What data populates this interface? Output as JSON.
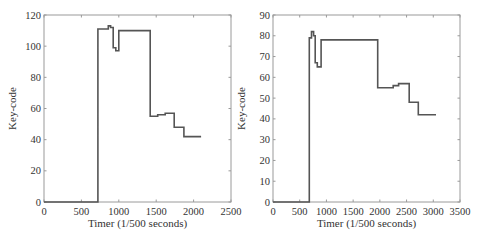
{
  "chart_data": [
    {
      "type": "line",
      "title": "",
      "xlabel": "Timer (1/500 seconds)",
      "ylabel": "Key-code",
      "xlim": [
        0,
        2500
      ],
      "ylim": [
        0,
        120
      ],
      "xticks": [
        0,
        500,
        1000,
        1500,
        2000,
        2500
      ],
      "yticks": [
        0,
        20,
        40,
        60,
        80,
        100,
        120
      ],
      "grid": false,
      "series": [
        {
          "name": "key-code",
          "step": true,
          "x": [
            0,
            720,
            720,
            860,
            860,
            890,
            890,
            925,
            925,
            960,
            960,
            1000,
            1000,
            1420,
            1420,
            1520,
            1520,
            1620,
            1620,
            1740,
            1740,
            1870,
            1870,
            2100
          ],
          "y": [
            0,
            0,
            111,
            111,
            113,
            113,
            112,
            112,
            99,
            99,
            97,
            97,
            110,
            110,
            55,
            55,
            56,
            56,
            57,
            57,
            48,
            48,
            42,
            42
          ]
        }
      ]
    },
    {
      "type": "line",
      "title": "",
      "xlabel": "Timer (1/500 seconds)",
      "ylabel": "Key-code",
      "xlim": [
        0,
        3500
      ],
      "ylim": [
        0,
        90
      ],
      "xticks": [
        0,
        500,
        1000,
        1500,
        2000,
        2500,
        3000,
        3500
      ],
      "yticks": [
        0,
        10,
        20,
        30,
        40,
        50,
        60,
        70,
        80,
        90
      ],
      "grid": false,
      "series": [
        {
          "name": "key-code",
          "step": true,
          "x": [
            0,
            680,
            680,
            720,
            720,
            760,
            760,
            790,
            790,
            830,
            830,
            900,
            900,
            1960,
            1960,
            2250,
            2250,
            2350,
            2350,
            2550,
            2550,
            2720,
            2720,
            3050
          ],
          "y": [
            0,
            0,
            79,
            79,
            82,
            82,
            80,
            80,
            67,
            67,
            65,
            65,
            78,
            78,
            55,
            55,
            56,
            56,
            57,
            57,
            48,
            48,
            42,
            42
          ]
        }
      ]
    }
  ]
}
